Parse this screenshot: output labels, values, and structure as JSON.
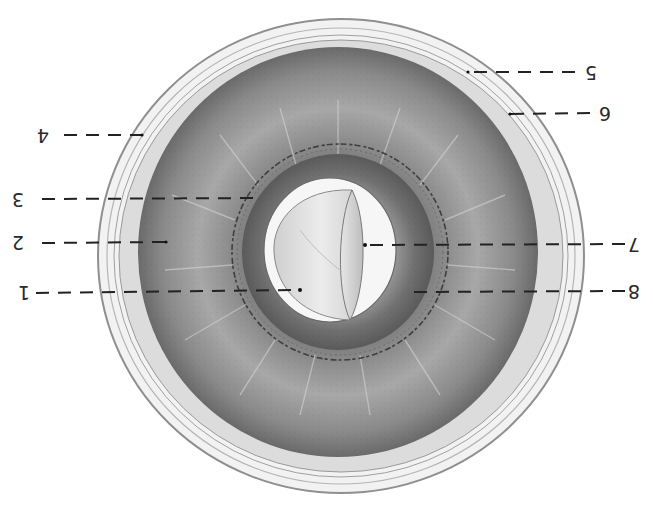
{
  "figure": {
    "orientation": "rotated 180 degrees",
    "caption_partial": "",
    "colors": {
      "background": "#ffffff",
      "sclera_ring": "#e8e8e8",
      "ring_outline": "#9a9a9a",
      "ciliary_body": "#8a8a8a",
      "ciliary_dark": "#5c5c5c",
      "iris_band": "#777777",
      "lens": "#e2e2e2",
      "pupil_gap": "#f6f6f6",
      "leader_line": "#222222"
    },
    "labels": [
      {
        "id": "1",
        "text": "1",
        "side": "left",
        "x": 18,
        "y": 287,
        "target": [
          300,
          290
        ]
      },
      {
        "id": "2",
        "text": "2",
        "side": "left",
        "x": 12,
        "y": 236,
        "target": [
          166,
          242
        ]
      },
      {
        "id": "3",
        "text": "3",
        "side": "left",
        "x": 12,
        "y": 193,
        "target": [
          262,
          198
        ]
      },
      {
        "id": "4",
        "text": "4",
        "side": "left",
        "x": 37,
        "y": 130,
        "target": [
          142,
          135
        ]
      },
      {
        "id": "5",
        "text": "5",
        "side": "right",
        "x": 586,
        "y": 66,
        "target": [
          468,
          72
        ]
      },
      {
        "id": "6",
        "text": "6",
        "side": "right",
        "x": 600,
        "y": 107,
        "target": [
          510,
          114
        ]
      },
      {
        "id": "7",
        "text": "7",
        "side": "right",
        "x": 628,
        "y": 237,
        "target": [
          365,
          245
        ]
      },
      {
        "id": "8",
        "text": "8",
        "side": "right",
        "x": 628,
        "y": 284,
        "target": [
          410,
          292
        ]
      }
    ]
  }
}
